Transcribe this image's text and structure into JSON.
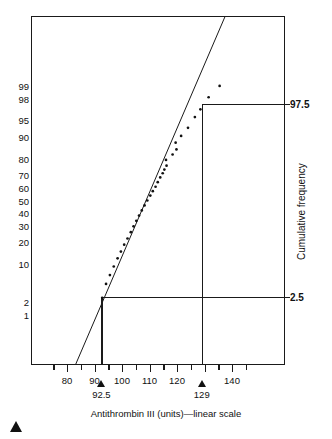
{
  "chart_data": {
    "type": "scatter",
    "title": "",
    "subtitle": "",
    "xlabel": "Antithrombin III (units)—linear scale",
    "ylabel": "Cumulative frequency",
    "xlim": [
      72,
      150
    ],
    "grid": false,
    "legend": null,
    "x_ticks": [
      80,
      90,
      100,
      110,
      120,
      130,
      140
    ],
    "x_tick_labels": [
      "80",
      "90",
      "100",
      "110",
      "120",
      "",
      "140"
    ],
    "y_ticks": [
      1,
      2,
      10,
      20,
      30,
      40,
      50,
      60,
      70,
      80,
      90,
      95,
      98,
      99
    ],
    "y_tick_labels": [
      "1",
      "2",
      "10",
      "20",
      "30",
      "40",
      "50",
      "60",
      "70",
      "80",
      "90",
      "95",
      "98",
      "99"
    ],
    "y_scale": "probit",
    "points": [
      {
        "x": 92.8,
        "y": 2.4
      },
      {
        "x": 94.2,
        "y": 4.5
      },
      {
        "x": 95.6,
        "y": 6.5
      },
      {
        "x": 97.0,
        "y": 9.0
      },
      {
        "x": 98.4,
        "y": 12.0
      },
      {
        "x": 99.6,
        "y": 15.0
      },
      {
        "x": 100.8,
        "y": 18.5
      },
      {
        "x": 102.0,
        "y": 22.0
      },
      {
        "x": 103.2,
        "y": 26.0
      },
      {
        "x": 104.2,
        "y": 30.0
      },
      {
        "x": 105.2,
        "y": 34.0
      },
      {
        "x": 106.2,
        "y": 38.0
      },
      {
        "x": 107.2,
        "y": 42.0
      },
      {
        "x": 108.2,
        "y": 46.0
      },
      {
        "x": 109.2,
        "y": 50.0
      },
      {
        "x": 110.3,
        "y": 54.0
      },
      {
        "x": 111.2,
        "y": 57.5
      },
      {
        "x": 112.2,
        "y": 61.0
      },
      {
        "x": 113.0,
        "y": 64.5
      },
      {
        "x": 113.9,
        "y": 68.0
      },
      {
        "x": 114.8,
        "y": 71.0
      },
      {
        "x": 115.4,
        "y": 73.5
      },
      {
        "x": 116.2,
        "y": 76.0
      },
      {
        "x": 116.0,
        "y": 79.5
      },
      {
        "x": 118.4,
        "y": 82.5
      },
      {
        "x": 119.8,
        "y": 85.0
      },
      {
        "x": 119.5,
        "y": 88.0
      },
      {
        "x": 121.5,
        "y": 90.5
      },
      {
        "x": 124.0,
        "y": 93.0
      },
      {
        "x": 126.5,
        "y": 95.5
      },
      {
        "x": 128.5,
        "y": 96.8
      },
      {
        "x": 131.5,
        "y": 98.2
      },
      {
        "x": 135.5,
        "y": 99.0
      }
    ],
    "fit_line": {
      "x0": 88.0,
      "y0": 0.35,
      "x1": 132.5,
      "y1": 99.9
    },
    "reference_lines": [
      {
        "percentile": 97.5,
        "value": 129,
        "label_right": "97.5",
        "label_bottom": "129"
      },
      {
        "percentile": 2.5,
        "value": 92.5,
        "label_right": "2.5",
        "label_bottom": "92.5"
      }
    ],
    "annotations": {
      "right_labels": [
        "97.5",
        "2.5"
      ],
      "bottom_callouts": [
        "92.5",
        "129"
      ]
    }
  },
  "axes": {
    "x_title": "Antithrombin III (units)—linear scale",
    "y_title": "Cumulative frequency"
  },
  "colors": {
    "line": "#1a1a1a",
    "point": "#111111",
    "frame": "#1a1a1a",
    "background": "#ffffff"
  },
  "figure": {
    "corner_marker": "solid-triangle-marker"
  }
}
